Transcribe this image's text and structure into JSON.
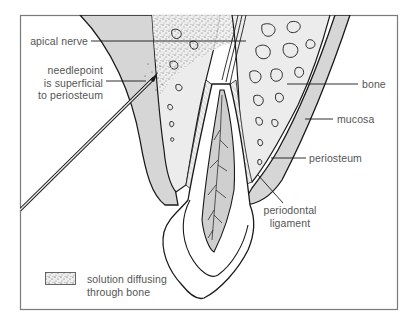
{
  "diagram": {
    "type": "anatomical cross-section",
    "colors": {
      "frame": "#7a7a7a",
      "outline": "#1a1a1a",
      "mucosa_fill": "#d6d6d6",
      "bone_fill": "#ececec",
      "pulp_fill": "#cfcfcf",
      "label_text": "#555555",
      "background": "#ffffff"
    }
  },
  "labels": {
    "apical_nerve": "apical nerve",
    "needlepoint": [
      "needlepoint",
      "is superficial",
      "to periosteum"
    ],
    "bone": "bone",
    "mucosa": "mucosa",
    "periosteum": "periosteum",
    "periodontal_ligament": [
      "periodontal",
      "ligament"
    ]
  },
  "legend": {
    "items": [
      {
        "swatch": "stippled",
        "label": [
          "solution diffusing",
          "through bone"
        ]
      }
    ]
  }
}
